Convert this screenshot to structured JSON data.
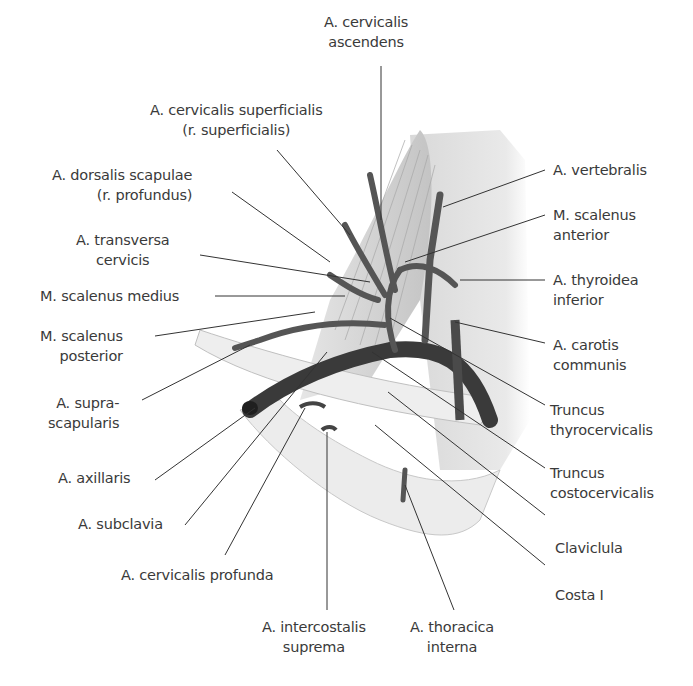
{
  "figure": {
    "labels": {
      "cervicalis_ascendens": [
        "A. cervicalis",
        "ascendens"
      ],
      "cervicalis_superficialis": [
        "A. cervicalis superficialis",
        "(r. superficialis)"
      ],
      "dorsalis_scapulae": [
        "A. dorsalis scapulae",
        "(r. profundus)"
      ],
      "transversa_cervicis": [
        "A. transversa",
        "cervicis"
      ],
      "scalenus_medius": [
        "M. scalenus medius"
      ],
      "scalenus_posterior": [
        "M. scalenus",
        "posterior"
      ],
      "suprascapularis": [
        "A. supra-",
        "scapularis"
      ],
      "axillaris": [
        "A. axillaris"
      ],
      "subclavia": [
        "A. subclavia"
      ],
      "cervicalis_profunda": [
        "A. cervicalis profunda"
      ],
      "intercostalis_suprema": [
        "A. intercostalis",
        "suprema"
      ],
      "thoracica_interna": [
        "A. thoracica",
        "interna"
      ],
      "vertebralis": [
        "A. vertebralis"
      ],
      "scalenus_anterior": [
        "M. scalenus",
        "anterior"
      ],
      "thyroidea_inferior": [
        "A. thyroidea",
        "inferior"
      ],
      "carotis_communis": [
        "A. carotis",
        "communis"
      ],
      "truncus_thyrocervicalis": [
        "Truncus",
        "thyrocervicalis"
      ],
      "truncus_costocervicalis": [
        "Truncus",
        "costocervicalis"
      ],
      "claviclula": [
        "Claviclula"
      ],
      "costa_i": [
        "Costa I"
      ]
    },
    "colors": {
      "text": "#3a3a3a",
      "leader": "#333333",
      "artery": "#555555",
      "artery_dark": "#2e2e2e",
      "muscle": "#d9d9d9",
      "bone": "#e8e8e8"
    }
  }
}
